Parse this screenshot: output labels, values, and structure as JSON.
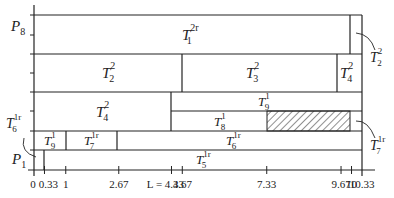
{
  "diagram": {
    "type": "strip-packing-schedule",
    "x_axis": {
      "ticks": [
        "0",
        "0.33",
        "1",
        "2.67",
        "L = 4.33",
        "4.67",
        "7.33",
        "9.67",
        "10",
        "10.33"
      ],
      "tick_values": [
        0,
        0.33,
        1,
        2.67,
        4.33,
        4.67,
        7.33,
        9.67,
        10,
        10.33
      ]
    },
    "y_labels": [
      {
        "name": "P",
        "sub": "8"
      },
      {
        "name": "P",
        "sub": "1"
      }
    ],
    "blocks": [
      {
        "id": "T1_2r",
        "base": "T",
        "sub": "1",
        "sup": "2r",
        "x0": 0,
        "x1": 10,
        "row": "top"
      },
      {
        "id": "T2_2_top_sliver",
        "base": "T",
        "sub": "2",
        "sup": "2",
        "x0": 10,
        "x1": 10.33,
        "row": "top",
        "callout": true
      },
      {
        "id": "T2_2",
        "base": "T",
        "sub": "2",
        "sup": "2",
        "x0": 0,
        "x1": 4.67,
        "row": "second"
      },
      {
        "id": "T3_2",
        "base": "T",
        "sub": "3",
        "sup": "2",
        "x0": 4.67,
        "x1": 9.67,
        "row": "second"
      },
      {
        "id": "T4_2_right",
        "base": "T",
        "sub": "4",
        "sup": "2",
        "x0": 9.67,
        "x1": 10.33,
        "row": "second"
      },
      {
        "id": "T4_2",
        "base": "T",
        "sub": "4",
        "sup": "2",
        "x0": 0,
        "x1": 4.33,
        "row": "third"
      },
      {
        "id": "T9_1_top",
        "base": "T",
        "sub": "9",
        "sup": "1",
        "x0": 4.33,
        "x1": 10.33,
        "row": "third-upper"
      },
      {
        "id": "T8_1",
        "base": "T",
        "sub": "8",
        "sup": "1",
        "x0": 4.33,
        "x1": 7.33,
        "row": "third-lower"
      },
      {
        "id": "hatched",
        "x0": 7.33,
        "x1": 10,
        "row": "third-lower",
        "hatched": true
      },
      {
        "id": "T7_1r_sliver",
        "base": "T",
        "sub": "7",
        "sup": "1r",
        "x0": 10,
        "x1": 10.33,
        "row": "third-lower",
        "callout": true
      },
      {
        "id": "T9_1",
        "base": "T",
        "sub": "9",
        "sup": "1",
        "x0": 0,
        "x1": 1,
        "row": "fourth"
      },
      {
        "id": "T7_1r",
        "base": "T",
        "sub": "7",
        "sup": "1r",
        "x0": 1,
        "x1": 2.67,
        "row": "fourth"
      },
      {
        "id": "T6_1r",
        "base": "T",
        "sub": "6",
        "sup": "1r",
        "x0": 2.67,
        "x1": 10.33,
        "row": "fourth"
      },
      {
        "id": "T6_1r_sliver",
        "base": "T",
        "sub": "6",
        "sup": "1r",
        "x0": 0,
        "x1": 0.33,
        "row": "bottom",
        "callout": true
      },
      {
        "id": "T5_1r",
        "base": "T",
        "sub": "5",
        "sup": "1r",
        "x0": 0.33,
        "x1": 10.33,
        "row": "bottom"
      }
    ],
    "labels": {
      "T1": {
        "base": "T",
        "sub": "1",
        "sup": "2r"
      },
      "T2_top": {
        "base": "T",
        "sub": "2",
        "sup": "2"
      },
      "T3": {
        "base": "T",
        "sub": "3",
        "sup": "2"
      },
      "T4_right": {
        "base": "T",
        "sub": "4",
        "sup": "2"
      },
      "T4_left": {
        "base": "T",
        "sub": "4",
        "sup": "2"
      },
      "T9_right": {
        "base": "T",
        "sub": "9",
        "sup": "1"
      },
      "T8": {
        "base": "T",
        "sub": "8",
        "sup": "1"
      },
      "T6_mid": {
        "base": "T",
        "sub": "6",
        "sup": "1r"
      },
      "T5": {
        "base": "T",
        "sub": "5",
        "sup": "1r"
      },
      "T9_left": {
        "base": "T",
        "sub": "9",
        "sup": "1"
      },
      "T7_left": {
        "base": "T",
        "sub": "7",
        "sup": "1r"
      },
      "T2_callout": {
        "base": "T",
        "sub": "2",
        "sup": "2"
      },
      "T7_callout": {
        "base": "T",
        "sub": "7",
        "sup": "1r"
      },
      "T6_callout": {
        "base": "T",
        "sub": "6",
        "sup": "1r"
      },
      "P8": {
        "base": "P",
        "sub": "8"
      },
      "P1": {
        "base": "P",
        "sub": "1"
      }
    }
  }
}
